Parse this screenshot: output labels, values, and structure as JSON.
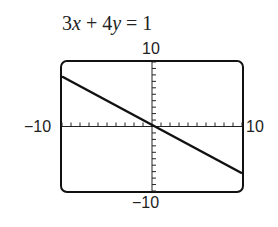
{
  "chart_data": {
    "type": "line",
    "title": "3x + 4y = 1",
    "equation": "3x + 4y = 1",
    "xlabel": "",
    "ylabel": "",
    "xlim": [
      -10,
      10
    ],
    "ylim": [
      -10,
      10
    ],
    "tick_labels": {
      "ymax": "10",
      "ymin": "−10",
      "xmin": "−10",
      "xmax": "10"
    },
    "grid": false,
    "x": [
      -10,
      10
    ],
    "series": [
      {
        "name": "y = (1 - 3x)/4",
        "x": [
          -10,
          10
        ],
        "values": [
          7.75,
          -7.25
        ]
      }
    ],
    "x_ticks_step": 1,
    "y_ticks_step": 1
  },
  "labels": {
    "eq_a": "3",
    "eq_x": "x",
    "eq_mid": " + 4",
    "eq_y": "y",
    "eq_end": " = 1",
    "ymax": "10",
    "ymin": "−10",
    "xmin": "−10",
    "xmax": "10"
  }
}
